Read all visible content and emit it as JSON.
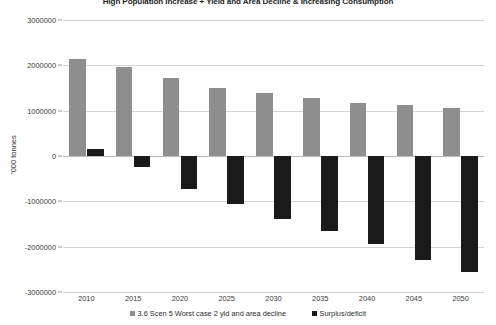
{
  "chart_data": {
    "type": "bar",
    "title": "High Population Increase + Yield and Area Decline & Increasing Consumption",
    "xlabel": "",
    "ylabel": "'000 tonnes",
    "categories": [
      "2010",
      "2015",
      "2020",
      "2025",
      "2030",
      "2035",
      "2040",
      "2045",
      "2050"
    ],
    "series": [
      {
        "name": "3.6 Scen 5 Worst case 2 yld and area decline",
        "color": "#8e8e8e",
        "values": [
          2150000,
          1970000,
          1720000,
          1500000,
          1400000,
          1270000,
          1180000,
          1120000,
          1050000
        ]
      },
      {
        "name": "Surplus/deficit",
        "color": "#1a1a1a",
        "values": [
          150000,
          -250000,
          -720000,
          -1050000,
          -1400000,
          -1650000,
          -1950000,
          -2300000,
          -2550000
        ]
      }
    ],
    "ylim": [
      -3000000,
      3000000
    ],
    "ytick_values": [
      3000000,
      2000000,
      1000000,
      0,
      -1000000,
      -2000000,
      -3000000
    ],
    "ytick_labels": [
      "3000000",
      "2000000",
      "1000000",
      "0",
      "-1000000",
      "-2000000",
      "-3000000"
    ],
    "grid": true,
    "legend_position": "bottom"
  }
}
